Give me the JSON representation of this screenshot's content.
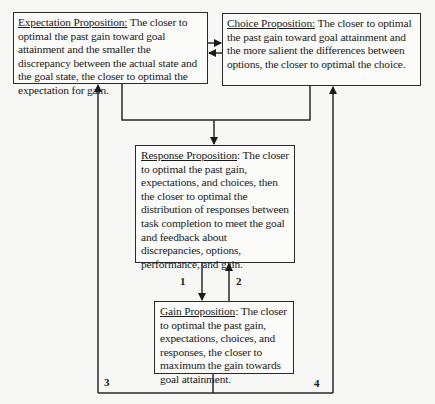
{
  "diagram": {
    "boxes": {
      "expectation": {
        "title": "Expectation Proposition:",
        "text": " The closer to optimal the past gain toward goal attainment and the smaller the discrepancy between the actual state and the goal state, the closer to optimal the expectation for gain."
      },
      "choice": {
        "title": "Choice Proposition:",
        "text": " The closer to optimal the past gain toward goal attainment and the more salient the differences between options, the closer to optimal the choice."
      },
      "response": {
        "title": "Response Proposition",
        "text": ": The closer to optimal the past gain, expectations, and choices, then the closer to optimal the distribution of responses between task completion to meet the goal and feedback about discrepancies, options, performance, and gain."
      },
      "gain": {
        "title": "Gain Proposition",
        "text": ": The closer to optimal the past gain, expectations, choices, and responses, the closer to maximum the gain towards goal attainment."
      }
    },
    "path_labels": {
      "p1": "1",
      "p2": "2",
      "p3": "3",
      "p4": "4"
    },
    "edges": [
      {
        "from": "expectation",
        "to": "choice"
      },
      {
        "from": "choice",
        "to": "expectation"
      },
      {
        "from": "expectation",
        "to": "response"
      },
      {
        "from": "choice",
        "to": "response"
      },
      {
        "from": "response",
        "to": "gain",
        "label": "1"
      },
      {
        "from": "gain",
        "to": "response",
        "label": "2"
      },
      {
        "from": "gain",
        "to": "expectation",
        "label": "3"
      },
      {
        "from": "gain",
        "to": "choice",
        "label": "4"
      }
    ]
  }
}
